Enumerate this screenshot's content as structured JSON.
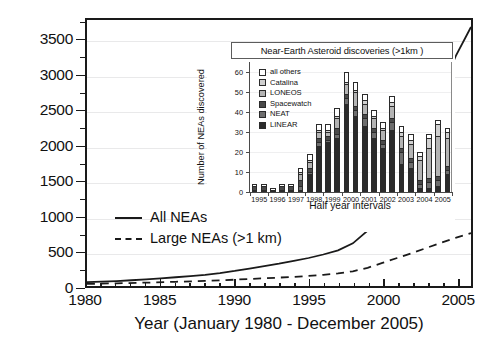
{
  "chart_data": [
    {
      "type": "line",
      "title": "",
      "xlabel": "Year (January 1980 - December 2005)",
      "ylabel": "Total number of known NEAs",
      "xlim": [
        1980,
        2006
      ],
      "ylim": [
        0,
        3800
      ],
      "xticks": [
        1980,
        1985,
        1990,
        1995,
        2000,
        2005
      ],
      "yticks": [
        0,
        500,
        1000,
        1500,
        2000,
        2500,
        3000,
        3500
      ],
      "grid": true,
      "legend_position": "lower-left",
      "series": [
        {
          "name": "All NEAs",
          "style": "solid",
          "color": "#1a1a1a",
          "x": [
            1980,
            1981,
            1982,
            1983,
            1984,
            1985,
            1986,
            1987,
            1988,
            1989,
            1990,
            1991,
            1992,
            1993,
            1994,
            1995,
            1996,
            1997,
            1998,
            1999,
            2000,
            2001,
            2002,
            2003,
            2004,
            2005,
            2006
          ],
          "y": [
            55,
            62,
            70,
            82,
            95,
            110,
            125,
            142,
            160,
            185,
            215,
            250,
            285,
            320,
            360,
            400,
            450,
            510,
            610,
            790,
            1150,
            1500,
            1900,
            2320,
            2800,
            3300,
            3700
          ]
        },
        {
          "name": "Large NEAs (>1 km)",
          "style": "dashed",
          "color": "#1a1a1a",
          "x": [
            1980,
            1982,
            1984,
            1986,
            1988,
            1990,
            1992,
            1994,
            1995,
            1996,
            1997,
            1998,
            1999,
            2000,
            2001,
            2002,
            2003,
            2004,
            2005,
            2006
          ],
          "y": [
            30,
            38,
            48,
            60,
            72,
            90,
            110,
            130,
            145,
            160,
            180,
            210,
            260,
            330,
            400,
            470,
            545,
            620,
            690,
            755
          ]
        }
      ]
    },
    {
      "type": "bar",
      "stacked": true,
      "title": "Near-Earth Asteroid discoveries (>1km )",
      "xlabel": "Half year intervals",
      "ylabel": "Number of NEAs discovered",
      "ylim": [
        0,
        65
      ],
      "yticks": [
        0,
        10,
        20,
        30,
        40,
        50,
        60
      ],
      "grid": true,
      "legend_position": "upper-left",
      "categories": [
        "1995 H1",
        "1995 H2",
        "1996 H1",
        "1996 H2",
        "1997 H1",
        "1997 H2",
        "1998 H1",
        "1998 H2",
        "1999 H1",
        "1999 H2",
        "2000 H1",
        "2000 H2",
        "2001 H1",
        "2001 H2",
        "2002 H1",
        "2002 H2",
        "2003 H1",
        "2003 H2",
        "2004 H1",
        "2004 H2",
        "2005 H1",
        "2005 H2"
      ],
      "xticklabels": [
        "1995",
        "1996",
        "1997",
        "1998",
        "1999",
        "2000",
        "2001",
        "2002",
        "2003",
        "2004",
        "2005"
      ],
      "series": [
        {
          "name": "LINEAR",
          "color": "#2b2b2b",
          "values": [
            0,
            0,
            0,
            0,
            0,
            1,
            9,
            23,
            25,
            27,
            44,
            38,
            33,
            27,
            22,
            31,
            14,
            12,
            2,
            2,
            3,
            9
          ]
        },
        {
          "name": "NEAT",
          "color": "#6e6e6e",
          "values": [
            1,
            1,
            0,
            1,
            1,
            2,
            1,
            2,
            1,
            2,
            3,
            3,
            4,
            3,
            2,
            4,
            6,
            3,
            2,
            3,
            3,
            2
          ]
        },
        {
          "name": "Spacewatch",
          "color": "#4a4a4a",
          "values": [
            2,
            2,
            1,
            2,
            2,
            3,
            2,
            2,
            2,
            3,
            2,
            2,
            2,
            2,
            2,
            2,
            2,
            2,
            2,
            2,
            2,
            2
          ]
        },
        {
          "name": "LONEOS",
          "color": "#b4b4b4",
          "values": [
            0,
            0,
            0,
            0,
            0,
            3,
            3,
            3,
            2,
            5,
            5,
            7,
            5,
            5,
            5,
            6,
            6,
            7,
            10,
            15,
            20,
            14
          ]
        },
        {
          "name": "Catalina",
          "color": "#d0d0d0",
          "values": [
            0,
            0,
            0,
            0,
            0,
            1,
            1,
            1,
            1,
            1,
            1,
            1,
            2,
            1,
            1,
            2,
            2,
            2,
            2,
            5,
            6,
            3
          ]
        },
        {
          "name": "all others",
          "color": "#ffffff",
          "values": [
            1,
            1,
            1,
            1,
            1,
            2,
            3,
            3,
            3,
            4,
            5,
            4,
            3,
            3,
            3,
            3,
            3,
            3,
            2,
            2,
            2,
            2
          ]
        }
      ]
    }
  ],
  "main": {
    "ylabel": "Total number of known NEAs",
    "xlabel": "Year (January 1980 - December 2005)",
    "yticks": [
      "3500",
      "3000",
      "2500",
      "2000",
      "1500",
      "1000",
      "500",
      "0"
    ],
    "xticks": [
      "1980",
      "1985",
      "1990",
      "1995",
      "2000",
      "2005"
    ],
    "legend": [
      {
        "label": "All NEAs",
        "style": "solid"
      },
      {
        "label": "Large NEAs (>1 km)",
        "style": "dashed"
      }
    ]
  },
  "inset": {
    "title": "Near-Earth Asteroid discoveries (>1km )",
    "ylabel": "Number of NEAs discovered",
    "xlabel": "Half year intervals",
    "yticks": [
      "60",
      "50",
      "40",
      "30",
      "20",
      "10",
      "0"
    ],
    "xticks": [
      "1995",
      "1996",
      "1997",
      "1998",
      "1999",
      "2000",
      "2001",
      "2002",
      "2003",
      "2004",
      "2005"
    ],
    "legend": [
      {
        "label": "all others",
        "color": "#ffffff"
      },
      {
        "label": "Catalina",
        "color": "#d0d0d0"
      },
      {
        "label": "LONEOS",
        "color": "#b4b4b4"
      },
      {
        "label": "Spacewatch",
        "color": "#4a4a4a"
      },
      {
        "label": "NEAT",
        "color": "#6e6e6e"
      },
      {
        "label": "LINEAR",
        "color": "#2b2b2b"
      }
    ]
  }
}
